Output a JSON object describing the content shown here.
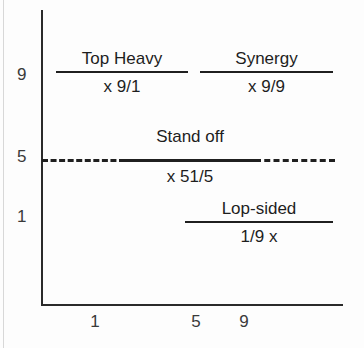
{
  "chart_data": {
    "type": "table",
    "title": "",
    "xlabel": "",
    "ylabel": "",
    "grid": false,
    "legend": "none",
    "xlim": [
      0,
      10
    ],
    "ylim": [
      0,
      10
    ],
    "x_ticks": [
      "1",
      "5",
      "9"
    ],
    "y_ticks": [
      "9",
      "5",
      "1"
    ],
    "divider": {
      "label": "Stand off",
      "ratio": "x 51/5",
      "y_value": 5,
      "style": "dashed"
    },
    "quadrants": [
      {
        "name": "Top Heavy",
        "ratio": "x 9/1",
        "position": "upper-left",
        "x": 1,
        "y": 9
      },
      {
        "name": "Synergy",
        "ratio": "x 9/9",
        "position": "upper-right",
        "x": 9,
        "y": 9
      },
      {
        "name": "Lop-sided",
        "ratio": "1/9 x",
        "position": "lower-right",
        "x": 9,
        "y": 1
      }
    ]
  },
  "axes": {
    "y_ticks": {
      "t9": "9",
      "t5": "5",
      "t1": "1"
    },
    "x_ticks": {
      "t1": "1",
      "t5": "5",
      "t9": "9"
    }
  },
  "cells": {
    "top_heavy": {
      "label": "Top Heavy",
      "ratio": "x 9/1"
    },
    "synergy": {
      "label": "Synergy",
      "ratio": "x 9/9"
    },
    "stand_off": {
      "label": "Stand off",
      "ratio": "x 51/5"
    },
    "lop_sided": {
      "label": "Lop-sided",
      "ratio": "1/9 x"
    }
  }
}
